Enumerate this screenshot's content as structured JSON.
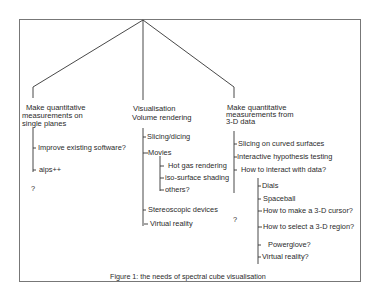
{
  "diagram": {
    "branches": [
      {
        "heading": [
          "Make quantitative",
          "measurements on",
          "single planes"
        ],
        "items": [
          "Improve existing software?",
          "aips++"
        ],
        "trailing": "?"
      },
      {
        "heading": [
          "Visualisation",
          "Volume rendering"
        ],
        "items": [
          "Slicing/dicing",
          "Movies",
          "Stereoscopic devices",
          "Virtual reality"
        ],
        "sub_items_movies": [
          "Hot gas rendering",
          "iso-surface shading",
          "others?"
        ]
      },
      {
        "heading": [
          "Make quantitative",
          "measurements from",
          "3-D data"
        ],
        "items": [
          "Slicing on curved surfaces",
          "Interactive hypothesis testing",
          "How to interact with data?"
        ],
        "sub_items_interact": [
          "Dials",
          "Spaceball",
          "How to make a 3-D cursor?",
          "How to select a 3-D region?",
          "Powerglove?",
          "Virtual reality?"
        ],
        "trailing": "?"
      }
    ],
    "caption": "Figure 1: the needs of spectral cube visualisation"
  }
}
